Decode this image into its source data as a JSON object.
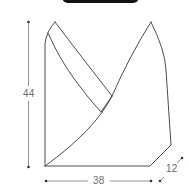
{
  "header": {
    "tab": "black-rounded-tab"
  },
  "product": {
    "type": "bag-dimension-drawing",
    "outline_color": "#3a3a3a",
    "dimension_color": "#6b6b6b"
  },
  "dimensions": {
    "height": "44",
    "width": "38",
    "depth": "12"
  }
}
